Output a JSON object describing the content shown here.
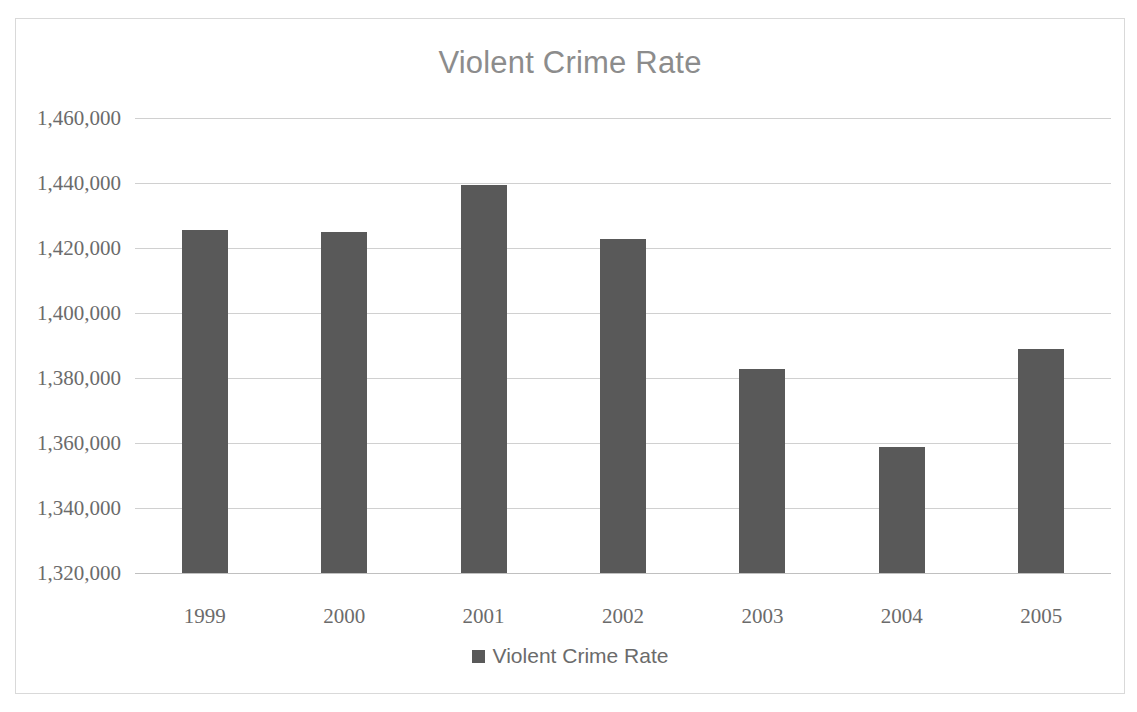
{
  "chart_data": {
    "type": "bar",
    "title": "Violent Crime Rate",
    "xlabel": "",
    "ylabel": "",
    "categories": [
      "1999",
      "2000",
      "2001",
      "2002",
      "2003",
      "2004",
      "2005"
    ],
    "values": [
      1425500,
      1425000,
      1439300,
      1422800,
      1382800,
      1358800,
      1389000
    ],
    "series": [
      {
        "name": "Violent Crime Rate",
        "values": [
          1425500,
          1425000,
          1439300,
          1422800,
          1382800,
          1358800,
          1389000
        ]
      }
    ],
    "ylim": [
      1320000,
      1460000
    ],
    "ytick_values": [
      1460000,
      1440000,
      1420000,
      1400000,
      1380000,
      1360000,
      1340000,
      1320000
    ],
    "ytick_labels": [
      "1,460,000",
      "1,440,000",
      "1,420,000",
      "1,400,000",
      "1,380,000",
      "1,360,000",
      "1,340,000",
      "1,320,000"
    ],
    "grid": true,
    "legend_position": "bottom",
    "legend": [
      "Violent Crime Rate"
    ],
    "bar_color": "#595959",
    "gridline_color": "#d0d0d0",
    "text_color": "#6b6b6b",
    "title_color": "#8c8c8c",
    "border_color": "#d9d9d9",
    "background_color": "#ffffff"
  },
  "legend": {
    "label": "Violent Crime Rate"
  }
}
